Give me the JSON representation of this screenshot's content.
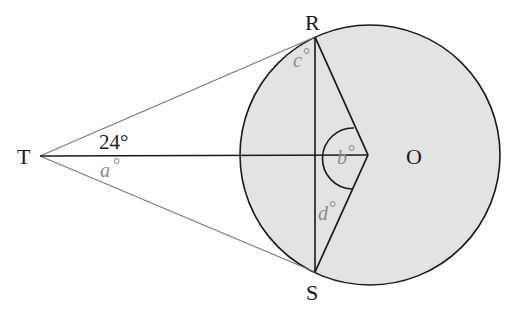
{
  "diagram": {
    "type": "circle-tangent-geometry",
    "colors": {
      "circle_fill": "#e3e3e3",
      "stroke_dark": "#1a1a1a",
      "stroke_gray": "#7a7a7a",
      "label_gray": "#8a8a8a"
    },
    "circle": {
      "label": "O",
      "cx": 370,
      "cy": 155,
      "r": 130
    },
    "points": {
      "T": {
        "label": "T",
        "x": 40,
        "y": 156
      },
      "R": {
        "label": "R",
        "x": 315,
        "y": 37
      },
      "S": {
        "label": "S",
        "x": 315,
        "y": 272
      },
      "O": {
        "label": "O",
        "x": 368,
        "y": 155
      }
    },
    "angles": {
      "known": {
        "label": "24°",
        "value": 24
      },
      "a": {
        "var": "a",
        "deg": "°"
      },
      "b": {
        "var": "b",
        "deg": "°"
      },
      "c": {
        "var": "c",
        "deg": "°"
      },
      "d": {
        "var": "d",
        "deg": "°"
      }
    }
  }
}
